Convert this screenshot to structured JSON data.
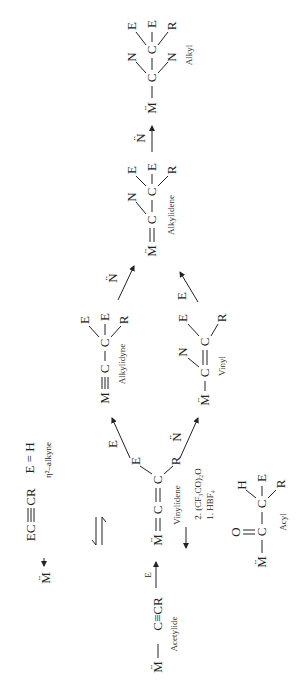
{
  "figure": {
    "orientation": "rotated-90-ccw",
    "species": {
      "alkyl": {
        "label": "Alkyl",
        "metal": "M̈",
        "atoms": [
          "C",
          "C"
        ],
        "substituents": [
          "N",
          "E",
          "E",
          "R",
          "N"
        ]
      },
      "alkylidene": {
        "label": "Alkylidene",
        "metal": "M̈",
        "atoms": [
          "C",
          "C"
        ],
        "substituents": [
          "N",
          "E",
          "E",
          "R"
        ]
      },
      "alkylidyne": {
        "label": "Alkylidyne",
        "metal": "M",
        "atoms": [
          "C",
          "C"
        ],
        "substituents": [
          "E",
          "E",
          "R"
        ]
      },
      "vinyl": {
        "label": "Vinyl",
        "metal": "M̈",
        "atoms": [
          "C",
          "C"
        ],
        "substituents": [
          "N",
          "E",
          "R"
        ]
      },
      "vinylidene": {
        "label": "Vinylidene",
        "metal": "M̈",
        "atoms": [
          "C",
          "C"
        ],
        "substituents": [
          "E",
          "R"
        ]
      },
      "alkyne": {
        "label": "η²–alkyne",
        "formula_left": "EC",
        "formula_right": "CR",
        "condition": "E = H",
        "metal": "M̈"
      },
      "acyl": {
        "label": "Acyl",
        "metal": "M̈",
        "atoms": [
          "C",
          "C"
        ],
        "substituents": [
          "O",
          "H",
          "E",
          "R"
        ]
      },
      "acetylide": {
        "label": "Acetylide",
        "metal": "M̈",
        "formula": "C≡CR"
      }
    },
    "reagents": {
      "nucleophile": "N̈",
      "electrophile": "E",
      "acyl_step1": "1. HBF₄",
      "acyl_step2": "2. (CF₃CO)₂O"
    }
  }
}
